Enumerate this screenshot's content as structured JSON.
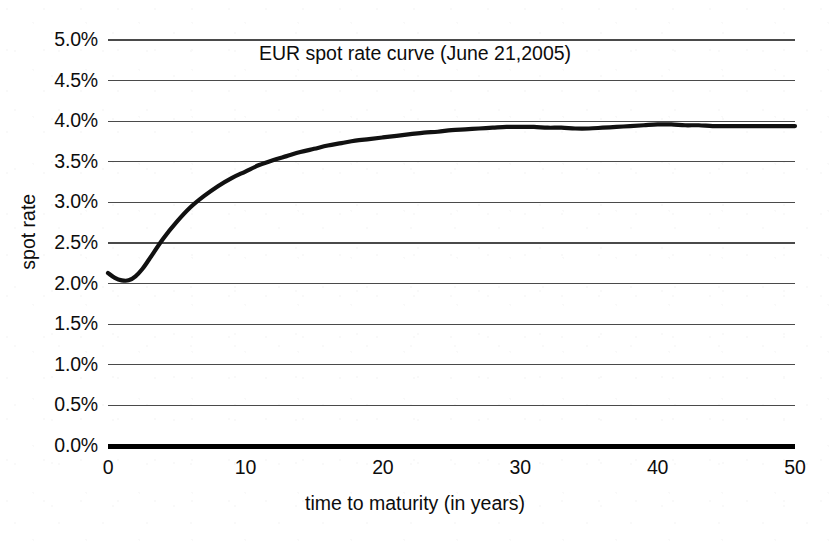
{
  "chart_data": {
    "type": "line",
    "title": "EUR spot rate curve (June 21,2005)",
    "xlabel": "time to maturity (in years)",
    "ylabel": "spot rate",
    "xlim": [
      0,
      50
    ],
    "ylim": [
      0,
      5
    ],
    "grid": true,
    "legend": null,
    "y_tick_labels": [
      "5.0%",
      "4.5%",
      "4.0%",
      "3.5%",
      "3.0%",
      "2.5%",
      "2.0%",
      "1.5%",
      "1.0%",
      "0.5%",
      "0.0%"
    ],
    "y_tick_values": [
      5.0,
      4.5,
      4.0,
      3.5,
      3.0,
      2.5,
      2.0,
      1.5,
      1.0,
      0.5,
      0.0
    ],
    "x_tick_labels": [
      "0",
      "10",
      "20",
      "30",
      "40",
      "50"
    ],
    "x_tick_values": [
      0,
      10,
      20,
      30,
      40,
      50
    ],
    "series": [
      {
        "name": "EUR spot rate",
        "color": "#111111",
        "x": [
          0,
          0.5,
          1,
          1.5,
          2,
          2.5,
          3,
          4,
          5,
          6,
          7,
          8,
          9,
          10,
          11,
          12,
          13,
          14,
          15,
          16,
          17,
          18,
          19,
          20,
          21,
          22,
          23,
          24,
          25,
          26,
          27,
          28,
          29,
          30,
          31,
          32,
          33,
          34,
          35,
          36,
          37,
          38,
          39,
          40,
          41,
          42,
          43,
          44,
          45,
          46,
          47,
          48,
          49,
          50
        ],
        "y": [
          2.13,
          2.07,
          2.04,
          2.04,
          2.09,
          2.18,
          2.3,
          2.55,
          2.76,
          2.94,
          3.08,
          3.2,
          3.3,
          3.38,
          3.46,
          3.52,
          3.57,
          3.62,
          3.66,
          3.7,
          3.73,
          3.76,
          3.78,
          3.8,
          3.82,
          3.84,
          3.86,
          3.87,
          3.89,
          3.9,
          3.91,
          3.92,
          3.93,
          3.93,
          3.93,
          3.92,
          3.92,
          3.91,
          3.91,
          3.92,
          3.93,
          3.94,
          3.95,
          3.96,
          3.96,
          3.95,
          3.95,
          3.94,
          3.94,
          3.94,
          3.94,
          3.94,
          3.94,
          3.94
        ]
      }
    ],
    "units": "percent"
  },
  "axes": {
    "y_ticks": [
      {
        "label": "5.0%",
        "value": 5.0
      },
      {
        "label": "4.5%",
        "value": 4.5
      },
      {
        "label": "4.0%",
        "value": 4.0
      },
      {
        "label": "3.5%",
        "value": 3.5
      },
      {
        "label": "3.0%",
        "value": 3.0
      },
      {
        "label": "2.5%",
        "value": 2.5
      },
      {
        "label": "2.0%",
        "value": 2.0
      },
      {
        "label": "1.5%",
        "value": 1.5
      },
      {
        "label": "1.0%",
        "value": 1.0
      },
      {
        "label": "0.5%",
        "value": 0.5
      },
      {
        "label": "0.0%",
        "value": 0.0
      }
    ],
    "x_ticks": [
      {
        "label": "0",
        "value": 0
      },
      {
        "label": "10",
        "value": 10
      },
      {
        "label": "20",
        "value": 20
      },
      {
        "label": "30",
        "value": 30
      },
      {
        "label": "40",
        "value": 40
      },
      {
        "label": "50",
        "value": 50
      }
    ]
  },
  "style": {
    "background": "#ffffff",
    "gridline_color": "#4a4a4a",
    "axis_color": "#000000",
    "curve_color": "#111111",
    "text_color": "#0d0d0d"
  }
}
